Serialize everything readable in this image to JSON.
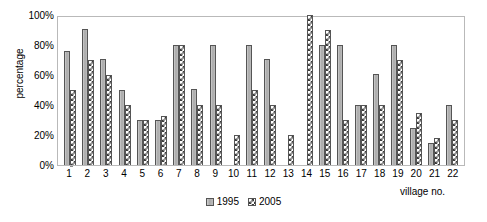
{
  "chart_data": {
    "type": "bar",
    "title": "",
    "xlabel": "village no.",
    "ylabel": "percentage",
    "ylim": [
      0,
      100
    ],
    "yticks": [
      "0%",
      "20%",
      "40%",
      "60%",
      "80%",
      "100%"
    ],
    "ytick_values": [
      0,
      20,
      40,
      60,
      80,
      100
    ],
    "grid": false,
    "legend_position": "bottom-center",
    "categories": [
      "1",
      "2",
      "3",
      "4",
      "5",
      "6",
      "7",
      "8",
      "9",
      "10",
      "11",
      "12",
      "13",
      "14",
      "15",
      "16",
      "17",
      "18",
      "19",
      "20",
      "21",
      "22"
    ],
    "series": [
      {
        "name": "1995",
        "color": "#b0b0b0",
        "pattern": "solid",
        "values": [
          76,
          91,
          71,
          50,
          30,
          30,
          80,
          51,
          80,
          null,
          80,
          71,
          null,
          null,
          80,
          80,
          40,
          61,
          80,
          25,
          15,
          40
        ]
      },
      {
        "name": "2005",
        "color": "#3a3a3a",
        "pattern": "diagonal-hatch",
        "values": [
          50,
          70,
          60,
          40,
          30,
          33,
          80,
          40,
          40,
          20,
          50,
          40,
          20,
          100,
          90,
          30,
          40,
          40,
          70,
          35,
          18,
          30
        ]
      }
    ]
  },
  "legend": {
    "items": [
      {
        "label": "1995",
        "series": "s1995"
      },
      {
        "label": "2005",
        "series": "s2005"
      }
    ]
  }
}
